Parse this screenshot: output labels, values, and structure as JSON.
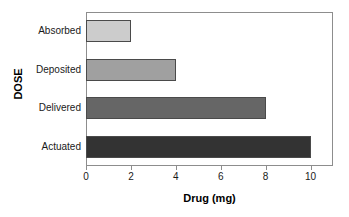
{
  "chart_data": {
    "type": "bar",
    "orientation": "horizontal",
    "title": "",
    "xlabel": "Drug (mg)",
    "ylabel": "DOSE",
    "categories": [
      "Actuated",
      "Delivered",
      "Deposited",
      "Absorbed"
    ],
    "values": [
      10,
      8,
      4,
      2
    ],
    "bar_colors": [
      "#333333",
      "#666666",
      "#a0a0a0",
      "#cccccc"
    ],
    "bar_edge_color": "#4a4a4a",
    "xlim": [
      0,
      11
    ],
    "xticks": [
      0,
      2,
      4,
      6,
      8,
      10
    ],
    "xtick_labels": [
      "0",
      "2",
      "4",
      "6",
      "8",
      "10"
    ],
    "grid": false,
    "legend": false,
    "frame_color": "#8d8d8d",
    "background": "#ffffff"
  },
  "bars": [
    {
      "label": "Absorbed",
      "value": 2,
      "color": "#cccccc"
    },
    {
      "label": "Deposited",
      "value": 4,
      "color": "#a0a0a0"
    },
    {
      "label": "Delivered",
      "value": 8,
      "color": "#666666"
    },
    {
      "label": "Actuated",
      "value": 10,
      "color": "#333333"
    }
  ]
}
